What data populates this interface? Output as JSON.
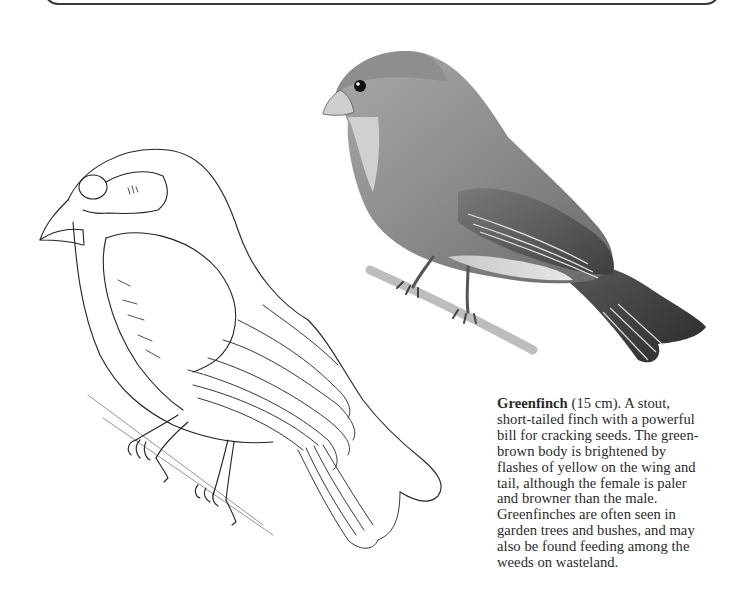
{
  "page": {
    "type": "field-guide-page",
    "frame": "rounded-top-border"
  },
  "illustrations": [
    {
      "id": "line-drawing",
      "subject": "Greenfinch outline drawing perched on branch",
      "style": "pen line art"
    },
    {
      "id": "shaded-drawing",
      "subject": "Greenfinch shaded illustration perched on branch",
      "style": "pencil shaded"
    }
  ],
  "caption": {
    "species": "Greenfinch",
    "size": "(15 cm).",
    "lines": [
      " A stout,",
      "short-tailed finch with a powerful",
      "bill for cracking seeds. The green-",
      "brown body is brightened by",
      "flashes of yellow on the wing and",
      "tail, although the female is paler",
      "and browner than the male.",
      "Greenfinches are often seen in",
      "garden trees and bushes, and may",
      "also be found feeding among the",
      "weeds on wasteland."
    ]
  },
  "colors": {
    "ink": "#2a2a2a",
    "frame": "#3a3a3a",
    "background": "#ffffff"
  }
}
